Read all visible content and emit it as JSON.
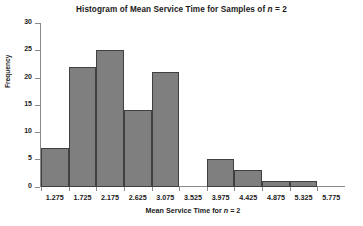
{
  "chart_data": {
    "type": "bar",
    "title": "Histogram of Mean Service Time for Samples of n = 2",
    "title_prefix": "Histogram of Mean Service Time for Samples of ",
    "title_var": "n",
    "title_suffix": " = 2",
    "xlabel": "Mean Service Time for n = 2",
    "xlabel_prefix": "Mean Service Time for ",
    "xlabel_var": "n",
    "xlabel_suffix": " = 2",
    "ylabel": "Frequency",
    "categories": [
      "1.275",
      "1.725",
      "2.175",
      "2.625",
      "3.075",
      "3.525",
      "3.975",
      "4.425",
      "4.875",
      "5.325",
      "5.775"
    ],
    "bin_starts": [
      1.275,
      1.725,
      2.175,
      2.625,
      3.075,
      3.525,
      3.975,
      4.425,
      4.875,
      5.325,
      5.775
    ],
    "bin_width": 0.45,
    "values": [
      7,
      22,
      25,
      14,
      21,
      0,
      5,
      3,
      1,
      1,
      0
    ],
    "ylim": [
      0,
      30
    ],
    "yticks": [
      0,
      5,
      10,
      15,
      20,
      25,
      30
    ],
    "ytick_labels": [
      "0",
      "5",
      "10",
      "15",
      "20",
      "25",
      "30"
    ],
    "grid": false,
    "legend": null,
    "bar_color": "#7f7f7f",
    "bar_edge_color": "#404040",
    "axis_color": "#8a8a8a",
    "background": "#ffffff"
  }
}
